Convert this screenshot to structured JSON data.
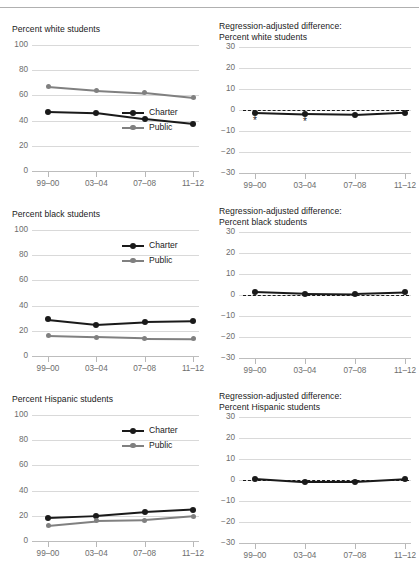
{
  "series_colors": {
    "charter": "#1a1a1a",
    "public": "#808080"
  },
  "legend": {
    "charter": "Charter",
    "public": "Public"
  },
  "x_categories": [
    "99–00",
    "03–04",
    "07–08",
    "11–12"
  ],
  "chart_data": [
    {
      "id": "white-levels",
      "type": "line",
      "title": "Percent white students",
      "xlabel": "",
      "ylabel": "",
      "categories": [
        "99–00",
        "03–04",
        "07–08",
        "11–12"
      ],
      "yticks": [
        0,
        20,
        40,
        60,
        80,
        100
      ],
      "ylim": [
        0,
        100
      ],
      "grid": true,
      "legend_position": "bottom-right",
      "series": [
        {
          "name": "Charter",
          "values": [
            47,
            46,
            41,
            37
          ]
        },
        {
          "name": "Public",
          "values": [
            67,
            64,
            62,
            58
          ]
        }
      ]
    },
    {
      "id": "white-regression",
      "type": "line",
      "title": "Regression-adjusted difference: Percent white students",
      "title_line1": "Regression-adjusted difference:",
      "title_line2": "Percent white students",
      "xlabel": "",
      "ylabel": "",
      "categories": [
        "99–00",
        "03–04",
        "07–08",
        "11–12"
      ],
      "yticks": [
        -30,
        -20,
        -10,
        0,
        10,
        20,
        30
      ],
      "ylim": [
        -30,
        30
      ],
      "grid": true,
      "zero_reference_line": 0,
      "legend_position": "none",
      "series": [
        {
          "name": "Difference",
          "values": [
            -1.3,
            -2.0,
            -2.3,
            -1.2
          ],
          "significance": [
            "*",
            "*",
            "",
            ""
          ]
        }
      ]
    },
    {
      "id": "black-levels",
      "type": "line",
      "title": "Percent black students",
      "xlabel": "",
      "ylabel": "",
      "categories": [
        "99–00",
        "03–04",
        "07–08",
        "11–12"
      ],
      "yticks": [
        0,
        20,
        40,
        60,
        80,
        100
      ],
      "ylim": [
        0,
        100
      ],
      "grid": true,
      "legend_position": "top-right",
      "series": [
        {
          "name": "Charter",
          "values": [
            29,
            25,
            27,
            27.5
          ]
        },
        {
          "name": "Public",
          "values": [
            16,
            15,
            14,
            13.8
          ]
        }
      ]
    },
    {
      "id": "black-regression",
      "type": "line",
      "title": "Regression-adjusted difference: Percent black students",
      "title_line1": "Regression-adjusted difference:",
      "title_line2": "Percent black students",
      "xlabel": "",
      "ylabel": "",
      "categories": [
        "99–00",
        "03–04",
        "07–08",
        "11–12"
      ],
      "yticks": [
        -30,
        -20,
        -10,
        0,
        10,
        20,
        30
      ],
      "ylim": [
        -30,
        30
      ],
      "grid": true,
      "zero_reference_line": 0,
      "legend_position": "none",
      "series": [
        {
          "name": "Difference",
          "values": [
            1.5,
            0.7,
            0.5,
            1.2
          ],
          "significance": [
            "",
            "",
            "",
            ""
          ]
        }
      ]
    },
    {
      "id": "hispanic-levels",
      "type": "line",
      "title": "Percent Hispanic students",
      "xlabel": "",
      "ylabel": "",
      "categories": [
        "99–00",
        "03–04",
        "07–08",
        "11–12"
      ],
      "yticks": [
        0,
        20,
        40,
        60,
        80,
        100
      ],
      "ylim": [
        0,
        100
      ],
      "grid": true,
      "legend_position": "top-right",
      "series": [
        {
          "name": "Charter",
          "values": [
            18.5,
            20,
            23,
            25
          ]
        },
        {
          "name": "Public",
          "values": [
            12.5,
            16,
            16.5,
            19.5
          ]
        }
      ]
    },
    {
      "id": "hispanic-regression",
      "type": "line",
      "title": "Regression-adjusted difference: Percent Hispanic students",
      "title_line1": "Regression-adjusted difference:",
      "title_line2": "Percent Hispanic students",
      "xlabel": "",
      "ylabel": "",
      "categories": [
        "99–00",
        "03–04",
        "07–08",
        "11–12"
      ],
      "yticks": [
        -30,
        -20,
        -10,
        0,
        10,
        20,
        30
      ],
      "ylim": [
        -30,
        30
      ],
      "grid": true,
      "zero_reference_line": 0,
      "legend_position": "none",
      "series": [
        {
          "name": "Difference",
          "values": [
            0.5,
            -1.0,
            -1.0,
            0.3
          ],
          "significance": [
            "",
            "",
            "",
            ""
          ]
        }
      ]
    }
  ]
}
